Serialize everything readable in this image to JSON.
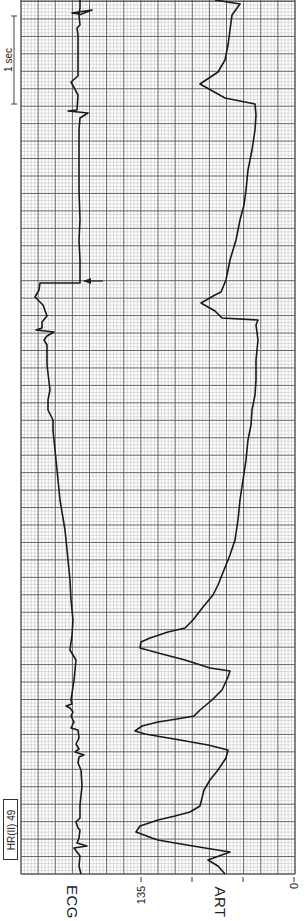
{
  "chart_data": {
    "type": "line",
    "title": "",
    "orientation": "rotated 90 degrees (time runs bottom-to-top)",
    "channels": [
      {
        "name": "ECG",
        "label": "ECG",
        "description": "ECG lead II trace with QRS spikes; a sudden baseline shift marked by an arrow"
      },
      {
        "name": "ART",
        "label": "ART",
        "description": "Arterial pressure waveform; large pulses near start, then declining pressure with small beats"
      }
    ],
    "heart_rate": {
      "label": "HR(II)",
      "value": 49
    },
    "art_axis": {
      "ticks": [
        135,
        "",
        "",
        0
      ],
      "labeled_ticks": [
        "135",
        "0"
      ],
      "ylim": [
        0,
        180
      ]
    },
    "time_scale": {
      "label": "1 sec"
    },
    "annotations": [
      {
        "type": "arrow",
        "target": "ECG baseline shift"
      }
    ],
    "grid": true,
    "series": [
      {
        "name": "ECG",
        "points_px": [
          [
            81,
            874
          ],
          [
            79,
            866
          ],
          [
            80,
            856
          ],
          [
            74,
            848
          ],
          [
            87,
            846
          ],
          [
            77,
            843
          ],
          [
            79,
            838
          ],
          [
            80,
            830
          ],
          [
            78,
            828
          ],
          [
            76,
            822
          ],
          [
            80,
            818
          ],
          [
            80,
            805
          ],
          [
            82,
            786
          ],
          [
            81,
            770
          ],
          [
            78,
            763
          ],
          [
            79,
            757
          ],
          [
            84,
            755
          ],
          [
            75,
            752
          ],
          [
            79,
            749
          ],
          [
            76,
            744
          ],
          [
            79,
            738
          ],
          [
            78,
            730
          ],
          [
            71,
            728
          ],
          [
            74,
            722
          ],
          [
            71,
            716
          ],
          [
            73,
            712
          ],
          [
            70,
            708
          ],
          [
            66,
            706
          ],
          [
            72,
            704
          ],
          [
            71,
            700
          ],
          [
            74,
            680
          ],
          [
            76,
            660
          ],
          [
            70,
            650
          ],
          [
            72,
            635
          ],
          [
            73,
            620
          ],
          [
            71,
            600
          ],
          [
            70,
            580
          ],
          [
            68,
            560
          ],
          [
            65,
            530
          ],
          [
            60,
            500
          ],
          [
            57,
            470
          ],
          [
            56,
            460
          ],
          [
            54,
            440
          ],
          [
            53,
            430
          ],
          [
            53,
            420
          ],
          [
            48,
            410
          ],
          [
            48,
            400
          ],
          [
            50,
            390
          ],
          [
            47,
            365
          ],
          [
            47,
            345
          ],
          [
            44,
            340
          ],
          [
            47,
            336
          ],
          [
            54,
            332
          ],
          [
            36,
            330
          ],
          [
            42,
            328
          ],
          [
            42,
            322
          ],
          [
            47,
            316
          ],
          [
            43,
            305
          ],
          [
            35,
            297
          ],
          [
            39,
            290
          ],
          [
            40,
            283
          ],
          [
            80,
            283
          ],
          [
            80,
            260
          ],
          [
            79,
            240
          ],
          [
            80,
            220
          ],
          [
            79,
            190
          ],
          [
            79,
            160
          ],
          [
            79,
            130
          ],
          [
            80,
            118
          ],
          [
            88,
            113
          ],
          [
            68,
            111
          ],
          [
            77,
            110
          ],
          [
            78,
            95
          ],
          [
            71,
            82
          ],
          [
            78,
            76
          ],
          [
            78,
            35
          ],
          [
            77,
            28
          ],
          [
            80,
            25
          ],
          [
            79,
            15
          ],
          [
            92,
            10
          ],
          [
            72,
            13
          ],
          [
            79,
            14
          ],
          [
            80,
            8
          ],
          [
            80,
            0
          ]
        ]
      },
      {
        "name": "ART",
        "points_px": [
          [
            225,
            874
          ],
          [
            218,
            866
          ],
          [
            208,
            860
          ],
          [
            230,
            852
          ],
          [
            205,
            848
          ],
          [
            175,
            843
          ],
          [
            158,
            840
          ],
          [
            152,
            838
          ],
          [
            136,
            832
          ],
          [
            140,
            826
          ],
          [
            158,
            820
          ],
          [
            175,
            816
          ],
          [
            190,
            812
          ],
          [
            200,
            806
          ],
          [
            204,
            790
          ],
          [
            210,
            780
          ],
          [
            218,
            770
          ],
          [
            226,
            758
          ],
          [
            228,
            750
          ],
          [
            208,
            745
          ],
          [
            180,
            740
          ],
          [
            145,
            734
          ],
          [
            135,
            731
          ],
          [
            142,
            726
          ],
          [
            158,
            722
          ],
          [
            183,
            718
          ],
          [
            194,
            716
          ],
          [
            200,
            710
          ],
          [
            212,
            700
          ],
          [
            222,
            690
          ],
          [
            228,
            677
          ],
          [
            230,
            671
          ],
          [
            210,
            668
          ],
          [
            185,
            660
          ],
          [
            162,
            654
          ],
          [
            140,
            648
          ],
          [
            141,
            642
          ],
          [
            150,
            638
          ],
          [
            168,
            632
          ],
          [
            185,
            628
          ],
          [
            193,
            620
          ],
          [
            203,
            607
          ],
          [
            213,
            595
          ],
          [
            218,
            585
          ],
          [
            224,
            570
          ],
          [
            230,
            555
          ],
          [
            235,
            540
          ],
          [
            238,
            520
          ],
          [
            240,
            500
          ],
          [
            243,
            480
          ],
          [
            246,
            460
          ],
          [
            248,
            440
          ],
          [
            251,
            425
          ],
          [
            252,
            410
          ],
          [
            255,
            395
          ],
          [
            256,
            380
          ],
          [
            256,
            360
          ],
          [
            258,
            340
          ],
          [
            256,
            325
          ],
          [
            258,
            320
          ],
          [
            222,
            318
          ],
          [
            215,
            311
          ],
          [
            201,
            303
          ],
          [
            215,
            295
          ],
          [
            221,
            292
          ],
          [
            226,
            280
          ],
          [
            230,
            260
          ],
          [
            236,
            240
          ],
          [
            240,
            220
          ],
          [
            244,
            205
          ],
          [
            246,
            190
          ],
          [
            248,
            170
          ],
          [
            252,
            150
          ],
          [
            255,
            130
          ],
          [
            256,
            115
          ],
          [
            255,
            104
          ],
          [
            225,
            98
          ],
          [
            200,
            84
          ],
          [
            218,
            72
          ],
          [
            225,
            60
          ],
          [
            228,
            45
          ],
          [
            230,
            30
          ],
          [
            232,
            15
          ],
          [
            240,
            4
          ],
          [
            215,
            0
          ]
        ]
      }
    ]
  },
  "labels": {
    "ecg": "ECG",
    "art": "ART",
    "hr": "HR(II)  49",
    "tick_135": "135",
    "tick_0": "0",
    "one_sec": "1 sec"
  },
  "colors": {
    "grid_minor": "#bdbdbd",
    "grid_major": "#555555",
    "trace": "#1a1a1a",
    "background": "#ffffff"
  }
}
